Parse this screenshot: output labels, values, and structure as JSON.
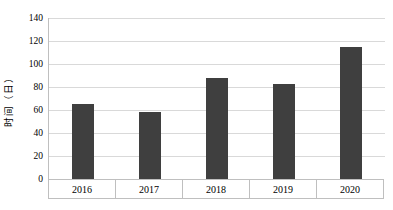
{
  "chart_data": {
    "type": "bar",
    "categories": [
      "2016",
      "2017",
      "2018",
      "2019",
      "2020"
    ],
    "values": [
      65,
      58,
      88,
      83,
      115
    ],
    "title": "",
    "xlabel": "",
    "ylabel": "时间（日）",
    "ylim": [
      0,
      140
    ],
    "ytick_step": 20,
    "yticks": [
      0,
      20,
      40,
      60,
      80,
      100,
      120,
      140
    ],
    "grid": true,
    "legend": "none",
    "colors": {
      "bar": "#3f3f3f",
      "gridline": "#d9d9d9",
      "axis_border": "#bfbfbf",
      "text": "#000000",
      "background": "#ffffff"
    }
  }
}
